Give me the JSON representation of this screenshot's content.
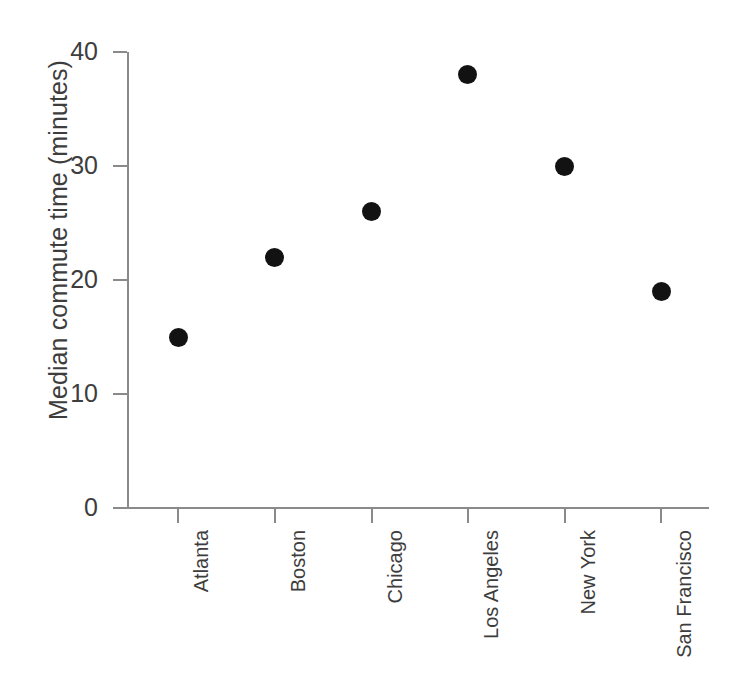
{
  "chart_data": {
    "type": "scatter",
    "title": "",
    "xlabel": "",
    "ylabel": "Median commute time (minutes)",
    "categories": [
      "Atlanta",
      "Boston",
      "Chicago",
      "Los Angeles",
      "New York",
      "San Francisco"
    ],
    "values": [
      15,
      22,
      26,
      38,
      30,
      19
    ],
    "series": [
      {
        "name": "Median commute time",
        "values": [
          15,
          22,
          26,
          38,
          30,
          19
        ]
      }
    ],
    "points": [
      {
        "category": "Atlanta",
        "value": 15
      },
      {
        "category": "Boston",
        "value": 22
      },
      {
        "category": "Chicago",
        "value": 26
      },
      {
        "category": "Los Angeles",
        "value": 38
      },
      {
        "category": "New York",
        "value": 30
      },
      {
        "category": "San Francisco",
        "value": 19
      }
    ],
    "ylim": [
      0,
      40
    ],
    "yticks": [
      0,
      10,
      20,
      30,
      40
    ],
    "ytick_labels": [
      "0",
      "10",
      "20",
      "30",
      "40"
    ],
    "grid": false,
    "legend": false,
    "legend_position": "none",
    "marker_color": "#121212",
    "axis_color": "#8a8a8a",
    "text_color": "#3d3d3d",
    "background_color": "#ffffff",
    "xtick_label_rotation": 90
  }
}
